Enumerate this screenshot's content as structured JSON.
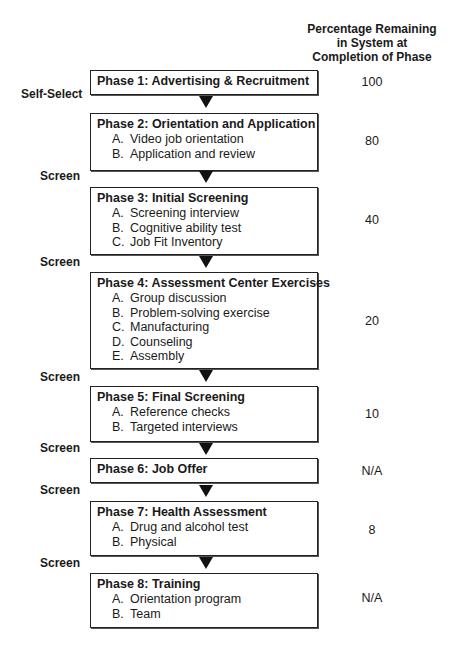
{
  "header": {
    "line1": "Percentage Remaining",
    "line2": "in System at",
    "line3": "Completion of Phase"
  },
  "phases": [
    {
      "title": "Phase 1:  Advertising & Recruitment",
      "items": [],
      "percentage": "100"
    },
    {
      "title": "Phase 2:  Orientation and Application",
      "items": [
        {
          "letter": "A.",
          "text": "Video job orientation"
        },
        {
          "letter": "B.",
          "text": "Application and review"
        }
      ],
      "percentage": "80"
    },
    {
      "title": "Phase 3:  Initial Screening",
      "items": [
        {
          "letter": "A.",
          "text": "Screening interview"
        },
        {
          "letter": "B.",
          "text": "Cognitive ability test"
        },
        {
          "letter": "C.",
          "text": "Job Fit Inventory"
        }
      ],
      "percentage": "40"
    },
    {
      "title": "Phase 4:  Assessment Center Exercises",
      "items": [
        {
          "letter": "A.",
          "text": "Group discussion"
        },
        {
          "letter": "B.",
          "text": "Problem-solving exercise"
        },
        {
          "letter": "C.",
          "text": "Manufacturing"
        },
        {
          "letter": "D.",
          "text": "Counseling"
        },
        {
          "letter": "E.",
          "text": "Assembly"
        }
      ],
      "percentage": "20"
    },
    {
      "title": "Phase 5:  Final Screening",
      "items": [
        {
          "letter": "A.",
          "text": "Reference checks"
        },
        {
          "letter": "B.",
          "text": "Targeted interviews"
        }
      ],
      "percentage": "10"
    },
    {
      "title": "Phase 6:  Job Offer",
      "items": [],
      "percentage": "N/A"
    },
    {
      "title": "Phase 7:  Health Assessment",
      "items": [
        {
          "letter": "A.",
          "text": "Drug and alcohol test"
        },
        {
          "letter": "B.",
          "text": "Physical"
        }
      ],
      "percentage": "8"
    },
    {
      "title": "Phase 8:  Training",
      "items": [
        {
          "letter": "A.",
          "text": "Orientation program"
        },
        {
          "letter": "B.",
          "text": "Team"
        }
      ],
      "percentage": "N/A"
    }
  ],
  "side_labels": [
    "Self-Select",
    "Screen",
    "Screen",
    "Screen",
    "Screen",
    "Screen",
    "Screen"
  ]
}
